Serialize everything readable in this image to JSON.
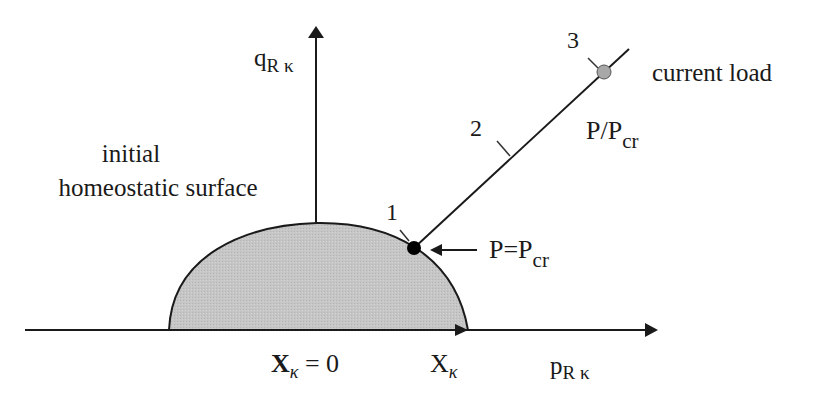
{
  "diagram": {
    "colors": {
      "surface_fill": "#c8c8c8",
      "stroke": "#1a1a1a",
      "point_1": "#000000",
      "point_3": "#a8a8a8"
    },
    "axes": {
      "vertical": {
        "label_main": "q",
        "label_sub": "R κ"
      },
      "horizontal": {
        "label_main": "p",
        "label_sub": "R κ"
      }
    },
    "surface_label": {
      "line1": "initial",
      "line2": "homeostatic surface"
    },
    "origin_label": {
      "main": "X",
      "sub": "κ",
      "suffix": " = 0"
    },
    "intercept_label": {
      "main": "X",
      "sub": "κ"
    },
    "points": [
      {
        "id": "1",
        "label": "1"
      },
      {
        "id": "2",
        "label": "2"
      },
      {
        "id": "3",
        "label": "3"
      }
    ],
    "critical_label": {
      "main": "P=P",
      "sub": "cr"
    },
    "ratio_label": {
      "main": "P/P",
      "sub": "cr"
    },
    "current_load_label": "current load"
  }
}
